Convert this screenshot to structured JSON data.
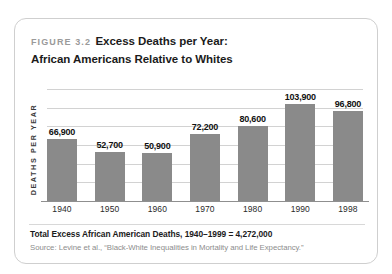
{
  "figure": {
    "number_label": "FIGURE 3.2",
    "title_line_1": "Excess Deaths per Year:",
    "title_line_2": "African Americans Relative to Whites",
    "y_axis_title": "DEATHS PER YEAR",
    "footer_total": "Total Excess African American Deaths, 1940–1999 = 4,272,000",
    "footer_source": "Source: Levine et al., “Black-White Inequalities in Mortality and Life Expectancy.”"
  },
  "chart_data": {
    "type": "bar",
    "title": "FIGURE 3.2 Excess Deaths per Year: African Americans Relative to Whites",
    "xlabel": "",
    "ylabel": "DEATHS PER YEAR",
    "categories": [
      "1940",
      "1950",
      "1960",
      "1970",
      "1980",
      "1990",
      "1998"
    ],
    "values": [
      66900,
      52700,
      50900,
      72200,
      80600,
      103900,
      96800
    ],
    "value_labels": [
      "66,900",
      "52,700",
      "50,900",
      "72,200",
      "80,600",
      "103,900",
      "96,800"
    ],
    "ylim": [
      0,
      120000
    ],
    "grid": true,
    "gridline_count": 6,
    "legend": null,
    "bar_color": "#8a8a8a",
    "gridline_color": "#d2d2d2",
    "annotations": [
      "Total Excess African American Deaths, 1940–1999 = 4,272,000",
      "Source: Levine et al., “Black-White Inequalities in Mortality and Life Expectancy.”"
    ]
  }
}
